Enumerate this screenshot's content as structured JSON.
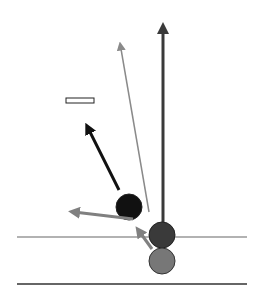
{
  "diagram": {
    "colors": {
      "background": "#ffffff",
      "black_ball": "#111111",
      "dark_ball": "#3a3a3a",
      "gray_ball": "#777777",
      "ball_outline": "#222222",
      "vertical_arrow": "#3a3a3a",
      "thin_arrow": "#8a8a8a",
      "black_arrow": "#111111",
      "gray_arrow": "#808080",
      "upper_line": "#999999",
      "lower_line": "#333333"
    },
    "balls": [
      {
        "name": "black-ball",
        "cx": 129,
        "cy": 207,
        "r": 13
      },
      {
        "name": "dark-ball",
        "cx": 162,
        "cy": 235,
        "r": 13
      },
      {
        "name": "gray-ball",
        "cx": 162,
        "cy": 261,
        "r": 13
      }
    ],
    "lines": [
      {
        "name": "upper-surface-line",
        "x1": 17,
        "y1": 237,
        "x2": 247,
        "y2": 237
      },
      {
        "name": "lower-surface-line",
        "x1": 17,
        "y1": 284,
        "x2": 247,
        "y2": 284
      }
    ],
    "arrows": [
      {
        "name": "vertical-arrow",
        "x1": 163,
        "y1": 220,
        "x2": 163,
        "y2": 20
      },
      {
        "name": "thin-gray-arrow",
        "x1": 149,
        "y1": 210,
        "x2": 119,
        "y2": 38
      },
      {
        "name": "black-arrow",
        "x1": 119,
        "y1": 190,
        "x2": 84,
        "y2": 120
      },
      {
        "name": "left-gray-arrow",
        "x1": 131,
        "y1": 219,
        "x2": 66,
        "y2": 211
      },
      {
        "name": "up-gray-arrow",
        "x1": 152,
        "y1": 249,
        "x2": 134,
        "y2": 224
      }
    ],
    "marker_rect": {
      "x": 66,
      "y": 98,
      "width": 28,
      "height": 5
    }
  }
}
